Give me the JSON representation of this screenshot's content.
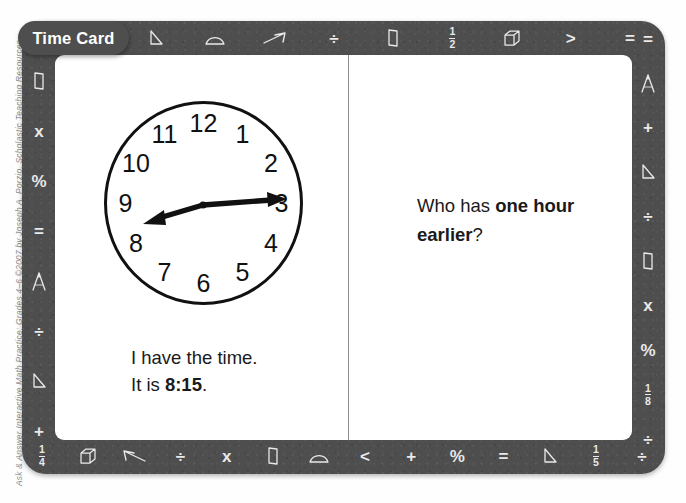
{
  "credit": "Ask & Answer Interactive Math Practice: Grades 4–6 ©2007 by Joseph A. Porzio, Scholastic Teaching Resources",
  "tab": {
    "label": "Time Card"
  },
  "colors": {
    "frame": "#4e4e4e",
    "card": "#ffffff",
    "glyph": "#e9e9e9",
    "text": "#1a1a1a",
    "divider": "#8d8d8d"
  },
  "left_panel": {
    "clock": {
      "numerals": [
        "12",
        "1",
        "2",
        "3",
        "4",
        "5",
        "6",
        "7",
        "8",
        "9",
        "10",
        "11"
      ],
      "time_shown": "8:15",
      "hour_hand_points_to": "8",
      "minute_hand_points_to": "3"
    },
    "statement_line1": "I have the time.",
    "statement_line2_prefix": "It is ",
    "statement_line2_bold": "8:15",
    "statement_line2_suffix": "."
  },
  "right_panel": {
    "question_prefix": "Who has ",
    "question_bold": "one hour earlier",
    "question_suffix": "?"
  },
  "border_glyphs": {
    "top": [
      {
        "name": "fraction-one-third",
        "kind": "fraction",
        "num": "1",
        "den": "3"
      },
      {
        "name": "triangle-icon",
        "kind": "shape",
        "shape": "triangle"
      },
      {
        "name": "protractor-icon",
        "kind": "shape",
        "shape": "protractor"
      },
      {
        "name": "arrow-right-icon",
        "kind": "shape",
        "shape": "arrow-right"
      },
      {
        "name": "divide-sign",
        "kind": "sym",
        "text": "÷"
      },
      {
        "name": "rectangular-prism-icon",
        "kind": "shape",
        "shape": "prism"
      },
      {
        "name": "fraction-one-half",
        "kind": "fraction",
        "num": "1",
        "den": "2"
      },
      {
        "name": "cube-icon",
        "kind": "shape",
        "shape": "cube"
      },
      {
        "name": "greater-than-sign",
        "kind": "sym",
        "text": ">"
      },
      {
        "name": "equals-sign",
        "kind": "sym",
        "text": "="
      }
    ],
    "bottom": [
      {
        "name": "fraction-one-fourth",
        "kind": "fraction",
        "num": "1",
        "den": "4"
      },
      {
        "name": "cube-icon",
        "kind": "shape",
        "shape": "cube"
      },
      {
        "name": "arrow-left-icon",
        "kind": "shape",
        "shape": "arrow-left"
      },
      {
        "name": "divide-sign",
        "kind": "sym",
        "text": "÷"
      },
      {
        "name": "multiply-sign",
        "kind": "sym",
        "text": "x"
      },
      {
        "name": "rectangular-prism-icon",
        "kind": "shape",
        "shape": "prism"
      },
      {
        "name": "protractor-icon",
        "kind": "shape",
        "shape": "protractor"
      },
      {
        "name": "less-than-sign",
        "kind": "sym",
        "text": "<"
      },
      {
        "name": "plus-sign",
        "kind": "sym",
        "text": "+"
      },
      {
        "name": "percent-sign",
        "kind": "sym",
        "text": "%"
      },
      {
        "name": "equals-sign",
        "kind": "sym",
        "text": "="
      },
      {
        "name": "triangle-icon",
        "kind": "shape",
        "shape": "triangle"
      },
      {
        "name": "fraction-one-fifth",
        "kind": "fraction",
        "num": "1",
        "den": "5"
      },
      {
        "name": "divide-sign",
        "kind": "sym",
        "text": "÷"
      }
    ],
    "left": [
      {
        "name": "rectangular-prism-icon",
        "kind": "shape",
        "shape": "prism"
      },
      {
        "name": "multiply-sign",
        "kind": "sym",
        "text": "x"
      },
      {
        "name": "percent-sign",
        "kind": "sym",
        "text": "%"
      },
      {
        "name": "equals-sign",
        "kind": "sym",
        "text": "="
      },
      {
        "name": "compass-icon",
        "kind": "shape",
        "shape": "compass"
      },
      {
        "name": "divide-sign",
        "kind": "sym",
        "text": "÷"
      },
      {
        "name": "triangle-icon",
        "kind": "shape",
        "shape": "triangle"
      },
      {
        "name": "plus-sign",
        "kind": "sym",
        "text": "+"
      }
    ],
    "right": [
      {
        "name": "equals-sign",
        "kind": "sym",
        "text": "="
      },
      {
        "name": "compass-icon",
        "kind": "shape",
        "shape": "compass"
      },
      {
        "name": "plus-sign",
        "kind": "sym",
        "text": "+"
      },
      {
        "name": "triangle-icon",
        "kind": "shape",
        "shape": "triangle"
      },
      {
        "name": "divide-sign",
        "kind": "sym",
        "text": "÷"
      },
      {
        "name": "rectangular-prism-icon",
        "kind": "shape",
        "shape": "prism"
      },
      {
        "name": "multiply-sign",
        "kind": "sym",
        "text": "x"
      },
      {
        "name": "percent-sign",
        "kind": "sym",
        "text": "%"
      },
      {
        "name": "fraction-one-eighth",
        "kind": "fraction",
        "num": "1",
        "den": "8"
      },
      {
        "name": "divide-sign",
        "kind": "sym",
        "text": "÷"
      }
    ]
  }
}
